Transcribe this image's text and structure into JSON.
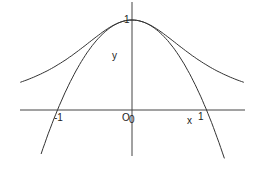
{
  "chart_data": {
    "type": "line",
    "title": "",
    "xlabel": "x",
    "ylabel": "y",
    "xlim": [
      -1.77,
      1.5
    ],
    "ylim": [
      -0.55,
      1.22
    ],
    "grid": false,
    "legend": null,
    "tick_labels": {
      "x": [
        "-1",
        "0",
        "1"
      ],
      "y": [
        "1"
      ],
      "origin": "O"
    },
    "series": [
      {
        "name": "bell curve y = 1/(1+x^2)",
        "x": [
          -1.77,
          -1.5,
          -1,
          -0.5,
          0,
          0.5,
          1,
          1.5,
          2.03
        ],
        "y": [
          0.24,
          0.31,
          0.5,
          0.8,
          1,
          0.8,
          0.5,
          0.31,
          0.2
        ]
      },
      {
        "name": "parabola y = 1 - x^2",
        "x": [
          -1.22,
          -1,
          -0.5,
          0,
          0.5,
          1,
          1.24
        ],
        "y": [
          -0.49,
          0,
          0.75,
          1,
          0.75,
          0,
          -0.54
        ]
      }
    ]
  },
  "labels": {
    "x_axis": "x",
    "y_axis": "y",
    "origin": "O",
    "origin_tick": "0",
    "tick_neg1": "-1",
    "tick_pos1": "1",
    "tick_y1": "1"
  }
}
